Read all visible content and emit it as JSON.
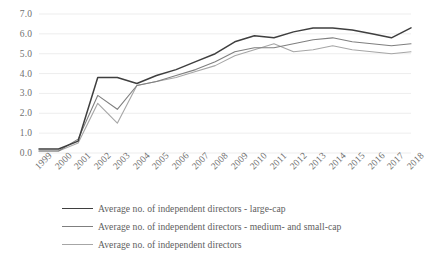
{
  "chart_data": {
    "type": "line",
    "title": "",
    "xlabel": "",
    "ylabel": "",
    "x": [
      "1999",
      "2000",
      "2001",
      "2002",
      "2003",
      "2004",
      "2005",
      "2006",
      "2007",
      "2008",
      "2009",
      "2010",
      "2011",
      "2012",
      "2013",
      "2014",
      "2015",
      "2016",
      "2017",
      "2018"
    ],
    "ylim": [
      0.0,
      7.0
    ],
    "ytick_labels": [
      "0.0",
      "1.0",
      "2.0",
      "3.0",
      "4.0",
      "5.0",
      "6.0",
      "7.0"
    ],
    "ytick_values": [
      0.0,
      1.0,
      2.0,
      3.0,
      4.0,
      5.0,
      6.0,
      7.0
    ],
    "grid": true,
    "legend_position": "bottom",
    "series": [
      {
        "name": "Average no. of independent directors - large-cap",
        "color": "#3f3f3f",
        "width": 1.5,
        "values": [
          0.2,
          0.2,
          0.6,
          3.8,
          3.8,
          3.5,
          3.9,
          4.2,
          4.6,
          5.0,
          5.6,
          5.9,
          5.8,
          6.1,
          6.3,
          6.3,
          6.2,
          6.0,
          5.8,
          6.3
        ]
      },
      {
        "name": "Average no. of independent directors - medium- and small-cap",
        "color": "#7f7f7f",
        "width": 1.1,
        "values": [
          0.1,
          0.1,
          0.7,
          2.9,
          2.2,
          3.4,
          3.6,
          3.9,
          4.2,
          4.6,
          5.1,
          5.3,
          5.3,
          5.5,
          5.7,
          5.8,
          5.6,
          5.5,
          5.4,
          5.5
        ]
      },
      {
        "name": "Average no. of independent directors",
        "color": "#a6a6a6",
        "width": 1.1,
        "values": [
          0.1,
          0.1,
          0.5,
          2.5,
          1.5,
          3.4,
          3.6,
          3.8,
          4.1,
          4.4,
          4.9,
          5.2,
          5.5,
          5.1,
          5.2,
          5.4,
          5.2,
          5.1,
          5.0,
          5.1
        ]
      }
    ]
  },
  "axes": {
    "y_ticks": [
      "7.0",
      "6.0",
      "5.0",
      "4.0",
      "3.0",
      "2.0",
      "1.0",
      "0.0"
    ],
    "x_ticks": [
      "1999",
      "2000",
      "2001",
      "2002",
      "2003",
      "2004",
      "2005",
      "2006",
      "2007",
      "2008",
      "2009",
      "2010",
      "2011",
      "2012",
      "2013",
      "2014",
      "2015",
      "2016",
      "2017",
      "2018"
    ]
  },
  "legend": {
    "items": [
      {
        "label": "Average no. of independent directors - large-cap",
        "color": "#3f3f3f",
        "width": 1.6
      },
      {
        "label": "Average no. of independent directors - medium- and small-cap",
        "color": "#7f7f7f",
        "width": 1.2
      },
      {
        "label": "Average no. of independent directors",
        "color": "#a6a6a6",
        "width": 1.1
      }
    ]
  },
  "style": {
    "grid_color": "#e8e8e8",
    "text_color": "#707070",
    "background": "#ffffff"
  }
}
